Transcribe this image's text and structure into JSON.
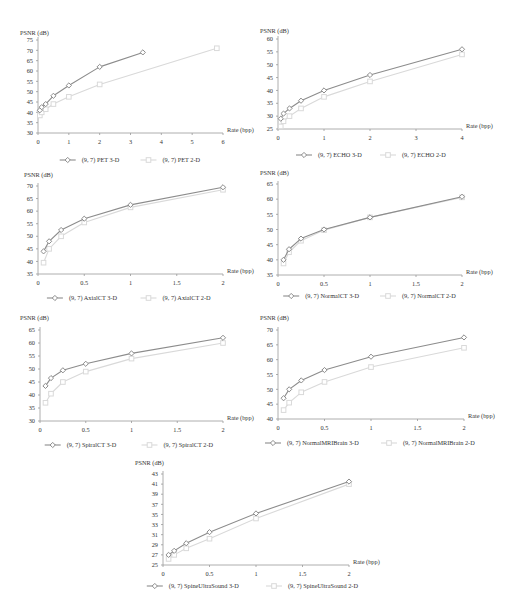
{
  "chart_data": [
    {
      "id": "pet",
      "type": "line",
      "title": "",
      "ylabel": "PSNR (dB)",
      "xlabel": "Rate (bpp)",
      "ylim": [
        30,
        75
      ],
      "ystep": 5,
      "xlim": [
        0,
        6
      ],
      "xticks": [
        0,
        1,
        2,
        3,
        4,
        5,
        6
      ],
      "series": [
        {
          "name": "(9, 7) PET 3-D",
          "marker": "diamond",
          "color": "#8c8c8c",
          "x": [
            0.06,
            0.12,
            0.25,
            0.5,
            1,
            2,
            3.4
          ],
          "y": [
            41,
            42.5,
            44,
            48,
            53,
            62,
            69
          ]
        },
        {
          "name": "(9, 7) PET 2-D",
          "marker": "square",
          "color": "#d9d9d9",
          "x": [
            0.06,
            0.12,
            0.25,
            0.5,
            1,
            2,
            5.8
          ],
          "y": [
            38.5,
            40,
            41.5,
            44,
            47.5,
            53.5,
            71
          ]
        }
      ]
    },
    {
      "id": "echo",
      "type": "line",
      "title": "",
      "ylabel": "PSNR (dB)",
      "xlabel": "Rate (bpp)",
      "ylim": [
        25,
        60
      ],
      "ystep": 5,
      "xlim": [
        0,
        4
      ],
      "xticks": [
        0,
        1,
        2,
        3,
        4
      ],
      "series": [
        {
          "name": "(9, 7) ECHO 3-D",
          "marker": "diamond",
          "color": "#8c8c8c",
          "x": [
            0.06,
            0.12,
            0.25,
            0.5,
            1,
            2,
            4
          ],
          "y": [
            29,
            31,
            33,
            36,
            40,
            46,
            56
          ]
        },
        {
          "name": "(9, 7) ECHO 2-D",
          "marker": "square",
          "color": "#d9d9d9",
          "x": [
            0.06,
            0.12,
            0.25,
            0.5,
            1,
            2,
            4
          ],
          "y": [
            26,
            28,
            30,
            33,
            37.5,
            43.5,
            54
          ]
        }
      ]
    },
    {
      "id": "axialct",
      "type": "line",
      "title": "",
      "ylabel": "PSNR (dB)",
      "xlabel": "Rate (bpp)",
      "ylim": [
        35,
        70
      ],
      "ystep": 5,
      "xlim": [
        0,
        2
      ],
      "xticks": [
        0,
        0.5,
        1,
        1.5,
        2
      ],
      "series": [
        {
          "name": "(9, 7) AxialCT 3-D",
          "marker": "diamond",
          "color": "#8c8c8c",
          "x": [
            0.06,
            0.12,
            0.25,
            0.5,
            1,
            2
          ],
          "y": [
            44,
            48,
            52.5,
            57,
            62.5,
            69.5
          ]
        },
        {
          "name": "(9, 7) AxialCT 2-D",
          "marker": "square",
          "color": "#d9d9d9",
          "x": [
            0.06,
            0.12,
            0.25,
            0.5,
            1,
            2
          ],
          "y": [
            39.5,
            45,
            50,
            55.5,
            61.5,
            68.5
          ]
        }
      ]
    },
    {
      "id": "normalct",
      "type": "line",
      "title": "",
      "ylabel": "PSNR (dB)",
      "xlabel": "Rate (bpp)",
      "ylim": [
        35,
        65
      ],
      "ystep": 5,
      "xlim": [
        0,
        2
      ],
      "xticks": [
        0,
        0.5,
        1,
        1.5,
        2
      ],
      "series": [
        {
          "name": "(9, 7) NormalCT 3-D",
          "marker": "diamond",
          "color": "#8c8c8c",
          "x": [
            0.06,
            0.12,
            0.25,
            0.5,
            1,
            2
          ],
          "y": [
            40,
            43.5,
            47,
            50,
            54,
            60.8
          ]
        },
        {
          "name": "(9, 7) NormalCT 2-D",
          "marker": "square",
          "color": "#d9d9d9",
          "x": [
            0.06,
            0.12,
            0.25,
            0.5,
            1,
            2
          ],
          "y": [
            38.8,
            42.5,
            46.3,
            49.8,
            54,
            60.6
          ]
        }
      ]
    },
    {
      "id": "spiralct",
      "type": "line",
      "title": "",
      "ylabel": "PSNR (dB)",
      "xlabel": "Rate (bpp)",
      "ylim": [
        30,
        65
      ],
      "ystep": 5,
      "xlim": [
        0,
        2
      ],
      "xticks": [
        0,
        0.5,
        1,
        1.5,
        2
      ],
      "series": [
        {
          "name": "(9, 7) SpiralCT 3-D",
          "marker": "diamond",
          "color": "#8c8c8c",
          "x": [
            0.06,
            0.12,
            0.25,
            0.5,
            1,
            2
          ],
          "y": [
            43.5,
            46.5,
            49.5,
            52,
            56,
            62
          ]
        },
        {
          "name": "(9, 7) SpiralCT 2-D",
          "marker": "square",
          "color": "#d9d9d9",
          "x": [
            0.06,
            0.12,
            0.25,
            0.5,
            1,
            2
          ],
          "y": [
            37,
            40.5,
            45,
            49,
            54,
            60
          ]
        }
      ]
    },
    {
      "id": "normalmribrain",
      "type": "line",
      "title": "",
      "ylabel": "PSNR (dB)",
      "xlabel": "Rate (bpp)",
      "ylim": [
        40,
        70
      ],
      "ystep": 5,
      "xlim": [
        0,
        2
      ],
      "xticks": [
        0,
        0.5,
        1,
        1.5,
        2
      ],
      "series": [
        {
          "name": "(9, 7) NormalMRIBrain 3-D",
          "marker": "diamond",
          "color": "#8c8c8c",
          "x": [
            0.06,
            0.12,
            0.25,
            0.5,
            1,
            2
          ],
          "y": [
            47,
            50,
            53,
            56.5,
            61,
            67.5
          ]
        },
        {
          "name": "(9, 7) NormalMRIBrain 2-D",
          "marker": "square",
          "color": "#d9d9d9",
          "x": [
            0.06,
            0.12,
            0.25,
            0.5,
            1,
            2
          ],
          "y": [
            43,
            45.5,
            49,
            52.5,
            57.5,
            64
          ]
        }
      ]
    },
    {
      "id": "spineultrasound",
      "type": "line",
      "title": "",
      "ylabel": "PSNR (dB)",
      "xlabel": "Rate (bpp)",
      "ylim": [
        25,
        43
      ],
      "ystep": 2,
      "xlim": [
        0,
        2
      ],
      "xticks": [
        0,
        0.5,
        1,
        1.5,
        2
      ],
      "series": [
        {
          "name": "(9, 7) SpineUltraSound 3-D",
          "marker": "diamond",
          "color": "#8c8c8c",
          "x": [
            0.06,
            0.12,
            0.25,
            0.5,
            1,
            2
          ],
          "y": [
            27,
            27.8,
            29.3,
            31.5,
            35.2,
            41.5
          ]
        },
        {
          "name": "(9, 7) SpineUltraSound 2-D",
          "marker": "square",
          "color": "#d9d9d9",
          "x": [
            0.06,
            0.12,
            0.25,
            0.5,
            1,
            2
          ],
          "y": [
            26.2,
            27,
            28.3,
            30.2,
            34.2,
            41
          ]
        }
      ]
    }
  ],
  "layout": [
    {
      "left": 0,
      "top": 2,
      "plotX": 38,
      "plotY": 38,
      "plotW": 185,
      "plotH": 93,
      "legendY": 160,
      "ylabelX": 20,
      "ylabelY": 33
    },
    {
      "left": 260,
      "top": 2,
      "plotX": 18,
      "plotY": 37,
      "plotW": 184,
      "plotH": 90,
      "legendY": 155,
      "ylabelX": 0,
      "ylabelY": 31
    },
    {
      "left": 0,
      "top": 170,
      "plotX": 38,
      "plotY": 16,
      "plotW": 185,
      "plotH": 88,
      "legendY": 130,
      "ylabelX": 24,
      "ylabelY": 7
    },
    {
      "left": 260,
      "top": 170,
      "plotX": 18,
      "plotY": 14,
      "plotW": 184,
      "plotH": 91,
      "legendY": 128,
      "ylabelX": 0,
      "ylabelY": 5
    },
    {
      "left": 0,
      "top": 320,
      "plotX": 40,
      "plotY": 10,
      "plotW": 183,
      "plotH": 91,
      "legendY": 127,
      "ylabelX": 20,
      "ylabelY": 0
    },
    {
      "left": 260,
      "top": 320,
      "plotX": 18,
      "plotY": 10,
      "plotW": 186,
      "plotH": 89,
      "legendY": 125,
      "ylabelX": 0,
      "ylabelY": 0
    },
    {
      "left": 130,
      "top": 460,
      "plotX": 33,
      "plotY": 14,
      "plotW": 186,
      "plotH": 91,
      "legendY": 128,
      "ylabelX": 5,
      "ylabelY": 5
    }
  ]
}
